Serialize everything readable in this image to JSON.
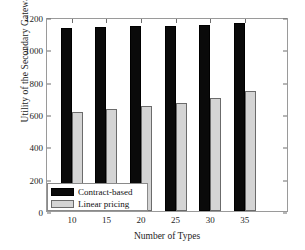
{
  "chart_data": {
    "type": "bar",
    "title": "",
    "xlabel": "Number of Types",
    "ylabel": "Utility of the Secondary Gateway",
    "categories": [
      "10",
      "15",
      "20",
      "25",
      "30",
      "35"
    ],
    "series": [
      {
        "name": "Contract-based",
        "color": "#0a0a0a",
        "values": [
          1135,
          1137,
          1142,
          1147,
          1153,
          1162
        ]
      },
      {
        "name": "Linear pricing",
        "color": "#d4d4d4",
        "values": [
          615,
          632,
          650,
          670,
          700,
          742
        ]
      }
    ],
    "ylim": [
      0,
      1200
    ],
    "yticks": [
      "0",
      "200",
      "400",
      "600",
      "800",
      "1000",
      "1200"
    ],
    "ytick_values": [
      0,
      200,
      400,
      600,
      800,
      1000,
      1200
    ],
    "xticks": [
      "10",
      "15",
      "20",
      "25",
      "30",
      "35"
    ],
    "grid": false,
    "legend_position": "lower left"
  },
  "legend": {
    "entries": [
      {
        "label": "Contract-based"
      },
      {
        "label": "Linear pricing"
      }
    ]
  },
  "axes": {
    "y_title": "Utility of the Secondary Gateway",
    "x_title": "Number of Types"
  }
}
